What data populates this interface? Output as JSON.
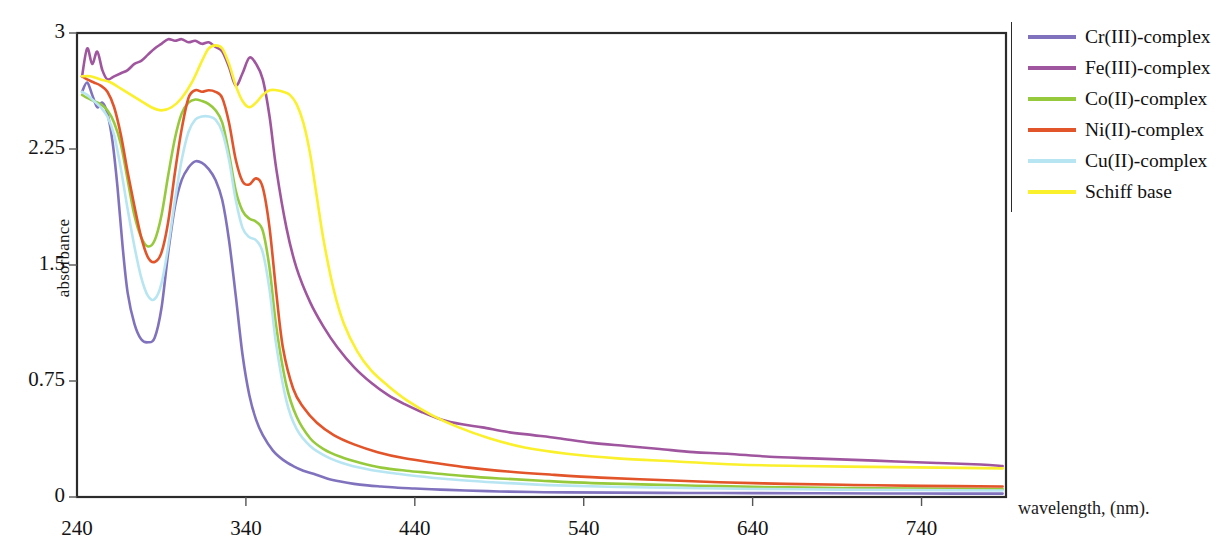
{
  "chart_data": {
    "type": "line",
    "title": "",
    "xlabel": "wavelength, (nm).",
    "ylabel": "absorbance",
    "xlim": [
      240,
      790
    ],
    "ylim": [
      0,
      3
    ],
    "xticks": [
      240,
      340,
      440,
      540,
      640,
      740
    ],
    "yticks": [
      0,
      0.75,
      1.5,
      2.25,
      3
    ],
    "xtick_labels": [
      "240",
      "340",
      "440",
      "540",
      "640",
      "740"
    ],
    "ytick_labels": [
      "0",
      "0.75",
      "1.5",
      "2.25",
      "3"
    ],
    "grid": false,
    "legend_position": "right",
    "series": [
      {
        "name": "Cr(III)-complex",
        "color": "#8172BE",
        "x": [
          243,
          246,
          249,
          252,
          255,
          258,
          261,
          264,
          267,
          270,
          274,
          278,
          282,
          286,
          290,
          294,
          298,
          302,
          306,
          310,
          314,
          318,
          322,
          326,
          330,
          334,
          338,
          342,
          346,
          350,
          356,
          362,
          368,
          374,
          380,
          388,
          396,
          404,
          412,
          420,
          430,
          440,
          455,
          470,
          490,
          510,
          530,
          560,
          600,
          640,
          680,
          720,
          760,
          788
        ],
        "y": [
          2.62,
          2.68,
          2.6,
          2.52,
          2.55,
          2.48,
          2.3,
          2.0,
          1.62,
          1.32,
          1.12,
          1.02,
          1.0,
          1.03,
          1.22,
          1.58,
          1.88,
          2.05,
          2.13,
          2.17,
          2.16,
          2.12,
          2.05,
          1.92,
          1.66,
          1.3,
          0.92,
          0.66,
          0.5,
          0.4,
          0.3,
          0.24,
          0.2,
          0.17,
          0.15,
          0.12,
          0.1,
          0.085,
          0.075,
          0.068,
          0.06,
          0.055,
          0.048,
          0.042,
          0.036,
          0.032,
          0.03,
          0.028,
          0.026,
          0.025,
          0.024,
          0.023,
          0.022,
          0.022
        ]
      },
      {
        "name": "Fe(III)-complex",
        "color": "#A0569E",
        "x": [
          243,
          246,
          249,
          252,
          255,
          258,
          262,
          266,
          270,
          274,
          278,
          282,
          286,
          290,
          294,
          298,
          302,
          306,
          310,
          314,
          318,
          322,
          326,
          330,
          334,
          338,
          342,
          346,
          350,
          354,
          358,
          364,
          370,
          378,
          386,
          394,
          404,
          414,
          424,
          434,
          444,
          456,
          468,
          480,
          495,
          510,
          525,
          545,
          565,
          585,
          605,
          625,
          650,
          675,
          700,
          725,
          750,
          775,
          788
        ],
        "y": [
          2.72,
          2.9,
          2.8,
          2.88,
          2.76,
          2.7,
          2.72,
          2.74,
          2.76,
          2.8,
          2.82,
          2.86,
          2.9,
          2.93,
          2.96,
          2.95,
          2.96,
          2.94,
          2.95,
          2.93,
          2.94,
          2.91,
          2.88,
          2.78,
          2.66,
          2.74,
          2.84,
          2.8,
          2.7,
          2.46,
          2.12,
          1.74,
          1.48,
          1.26,
          1.1,
          0.97,
          0.84,
          0.74,
          0.66,
          0.6,
          0.55,
          0.5,
          0.47,
          0.45,
          0.42,
          0.4,
          0.38,
          0.35,
          0.33,
          0.31,
          0.29,
          0.28,
          0.26,
          0.25,
          0.24,
          0.23,
          0.22,
          0.21,
          0.2
        ]
      },
      {
        "name": "Co(II)-complex",
        "color": "#96CA3C",
        "x": [
          243,
          246,
          250,
          254,
          258,
          262,
          266,
          270,
          274,
          278,
          282,
          286,
          290,
          294,
          298,
          302,
          306,
          310,
          314,
          318,
          322,
          326,
          330,
          334,
          338,
          342,
          346,
          350,
          354,
          358,
          364,
          370,
          378,
          386,
          396,
          408,
          420,
          435,
          450,
          470,
          490,
          515,
          545,
          580,
          620,
          660,
          700,
          740,
          788
        ],
        "y": [
          2.6,
          2.58,
          2.56,
          2.54,
          2.5,
          2.42,
          2.28,
          2.05,
          1.82,
          1.68,
          1.62,
          1.66,
          1.82,
          2.08,
          2.32,
          2.48,
          2.55,
          2.57,
          2.56,
          2.54,
          2.5,
          2.42,
          2.22,
          1.98,
          1.85,
          1.8,
          1.78,
          1.72,
          1.48,
          1.1,
          0.72,
          0.52,
          0.38,
          0.31,
          0.26,
          0.22,
          0.19,
          0.17,
          0.155,
          0.135,
          0.12,
          0.105,
          0.09,
          0.08,
          0.07,
          0.062,
          0.058,
          0.055,
          0.052
        ]
      },
      {
        "name": "Ni(II)-complex",
        "color": "#E2542A",
        "x": [
          243,
          246,
          250,
          254,
          258,
          262,
          266,
          270,
          274,
          278,
          282,
          286,
          290,
          294,
          298,
          302,
          306,
          310,
          314,
          318,
          322,
          326,
          330,
          334,
          338,
          342,
          346,
          350,
          354,
          358,
          362,
          368,
          374,
          382,
          392,
          404,
          418,
          434,
          452,
          472,
          495,
          520,
          550,
          585,
          620,
          660,
          700,
          740,
          788
        ],
        "y": [
          2.72,
          2.7,
          2.68,
          2.66,
          2.62,
          2.52,
          2.34,
          2.1,
          1.88,
          1.68,
          1.55,
          1.52,
          1.58,
          1.78,
          2.1,
          2.38,
          2.58,
          2.63,
          2.62,
          2.63,
          2.62,
          2.58,
          2.42,
          2.18,
          2.04,
          2.02,
          2.06,
          2.0,
          1.74,
          1.32,
          0.96,
          0.7,
          0.58,
          0.48,
          0.4,
          0.34,
          0.29,
          0.25,
          0.22,
          0.19,
          0.165,
          0.145,
          0.125,
          0.11,
          0.095,
          0.085,
          0.078,
          0.072,
          0.068
        ]
      },
      {
        "name": "Cu(II)-complex",
        "color": "#B8E5F2",
        "x": [
          243,
          246,
          250,
          254,
          258,
          262,
          266,
          270,
          274,
          278,
          282,
          286,
          290,
          294,
          298,
          302,
          306,
          310,
          314,
          318,
          322,
          326,
          330,
          334,
          338,
          342,
          346,
          350,
          354,
          358,
          364,
          370,
          378,
          388,
          400,
          414,
          430,
          450,
          472,
          495,
          525,
          560,
          600,
          645,
          690,
          735,
          788
        ],
        "y": [
          2.62,
          2.6,
          2.56,
          2.52,
          2.46,
          2.34,
          2.12,
          1.86,
          1.62,
          1.42,
          1.3,
          1.28,
          1.38,
          1.62,
          1.92,
          2.18,
          2.36,
          2.44,
          2.46,
          2.46,
          2.44,
          2.36,
          2.18,
          1.92,
          1.74,
          1.68,
          1.66,
          1.58,
          1.34,
          0.98,
          0.62,
          0.44,
          0.33,
          0.26,
          0.21,
          0.175,
          0.15,
          0.125,
          0.105,
          0.09,
          0.075,
          0.065,
          0.058,
          0.052,
          0.048,
          0.045,
          0.042
        ]
      },
      {
        "name": "Schiff base",
        "color": "#FAF02C",
        "x": [
          243,
          248,
          254,
          260,
          266,
          272,
          278,
          284,
          290,
          296,
          302,
          308,
          314,
          318,
          322,
          326,
          330,
          334,
          338,
          342,
          346,
          350,
          354,
          358,
          362,
          366,
          370,
          374,
          378,
          382,
          386,
          392,
          398,
          406,
          414,
          424,
          436,
          450,
          466,
          484,
          505,
          530,
          560,
          595,
          630,
          670,
          710,
          750,
          788
        ],
        "y": [
          2.72,
          2.72,
          2.7,
          2.68,
          2.64,
          2.6,
          2.56,
          2.52,
          2.5,
          2.52,
          2.58,
          2.68,
          2.82,
          2.9,
          2.92,
          2.9,
          2.8,
          2.66,
          2.56,
          2.52,
          2.55,
          2.6,
          2.63,
          2.63,
          2.62,
          2.6,
          2.54,
          2.42,
          2.22,
          1.94,
          1.66,
          1.34,
          1.12,
          0.94,
          0.82,
          0.72,
          0.62,
          0.53,
          0.45,
          0.38,
          0.32,
          0.28,
          0.25,
          0.23,
          0.21,
          0.2,
          0.195,
          0.19,
          0.185
        ]
      }
    ]
  },
  "legend": {
    "items": [
      {
        "label": "Cr(III)-complex",
        "color": "#8172BE"
      },
      {
        "label": "Fe(III)-complex",
        "color": "#A0569E"
      },
      {
        "label": "Co(II)-complex",
        "color": "#96CA3C"
      },
      {
        "label": "Ni(II)-complex",
        "color": "#E2542A"
      },
      {
        "label": "Cu(II)-complex",
        "color": "#B8E5F2"
      },
      {
        "label": "Schiff base",
        "color": "#FAF02C"
      }
    ]
  },
  "axes": {
    "y_title": "absorbance",
    "x_title": "wavelength, (nm).",
    "y_tick_labels": [
      "3",
      "2.25",
      "1.5",
      "0.75",
      "0"
    ],
    "x_tick_labels": [
      "240",
      "340",
      "440",
      "540",
      "640",
      "740"
    ]
  },
  "style": {
    "frame_color": "#2b2b2b",
    "background": "#ffffff",
    "text_color": "#141414"
  }
}
